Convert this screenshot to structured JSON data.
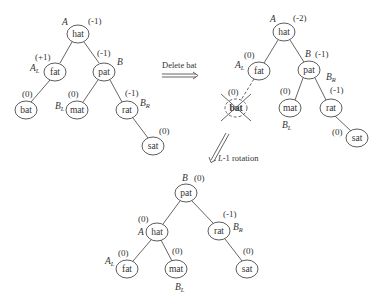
{
  "figure": {
    "step1_arrow_label": "Delete bat",
    "step2_arrow_label": "L-1 rotation"
  },
  "trees": {
    "before": {
      "nodes": [
        {
          "id": "hat",
          "key": "hat",
          "bf": "(-1)",
          "label": "A",
          "label_sub": ""
        },
        {
          "id": "fat",
          "key": "fat",
          "bf": "(+1)",
          "label": "A",
          "label_sub": "L"
        },
        {
          "id": "pat",
          "key": "pat",
          "bf": "(-1)",
          "label": "B",
          "label_sub": ""
        },
        {
          "id": "bat",
          "key": "bat",
          "bf": "(0)",
          "label": "",
          "label_sub": ""
        },
        {
          "id": "mat",
          "key": "mat",
          "bf": "(0)",
          "label": "B",
          "label_sub": "L"
        },
        {
          "id": "rat",
          "key": "rat",
          "bf": "(-1)",
          "label": "B",
          "label_sub": "R"
        },
        {
          "id": "sat",
          "key": "sat",
          "bf": "(0)",
          "label": "",
          "label_sub": ""
        }
      ]
    },
    "after_delete": {
      "nodes": [
        {
          "id": "hat",
          "key": "hat",
          "bf": "(-2)",
          "label": "A",
          "label_sub": ""
        },
        {
          "id": "fat",
          "key": "fat",
          "bf": "(0)",
          "label": "A",
          "label_sub": "L"
        },
        {
          "id": "pat",
          "key": "pat",
          "bf": "(-1)",
          "label": "B",
          "label_sub": ""
        },
        {
          "id": "bat",
          "key": "bat",
          "bf": "(0)",
          "label": "",
          "label_sub": "",
          "deleted": true
        },
        {
          "id": "mat",
          "key": "mat",
          "bf": "(0)",
          "label": "B",
          "label_sub": "L"
        },
        {
          "id": "rat",
          "key": "rat",
          "bf": "(-1)",
          "label": "B",
          "label_sub": "R"
        },
        {
          "id": "sat",
          "key": "sat",
          "bf": "(0)",
          "label": "",
          "label_sub": ""
        }
      ]
    },
    "after_rotation": {
      "nodes": [
        {
          "id": "pat",
          "key": "pat",
          "bf": "(0)",
          "label": "B",
          "label_sub": ""
        },
        {
          "id": "hat",
          "key": "hat",
          "bf": "(0)",
          "label": "A",
          "label_sub": ""
        },
        {
          "id": "rat",
          "key": "rat",
          "bf": "(-1)",
          "label": "B",
          "label_sub": "R"
        },
        {
          "id": "fat",
          "key": "fat",
          "bf": "(0)",
          "label": "A",
          "label_sub": "L"
        },
        {
          "id": "mat",
          "key": "mat",
          "bf": "(0)",
          "label": "B",
          "label_sub": "L"
        },
        {
          "id": "sat",
          "key": "sat",
          "bf": "(0)",
          "label": "",
          "label_sub": ""
        }
      ]
    }
  }
}
